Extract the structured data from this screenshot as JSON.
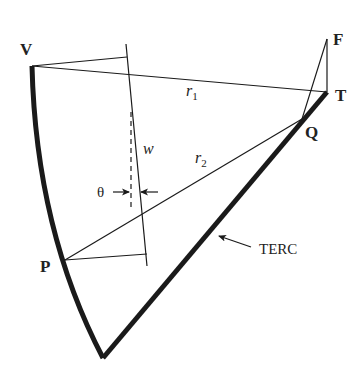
{
  "diagram": {
    "points": {
      "V": {
        "label": "V",
        "x": 32,
        "y": 66
      },
      "T": {
        "label": "T",
        "x": 327,
        "y": 92
      },
      "F": {
        "label": "F",
        "x": 327,
        "y": 39
      },
      "Q": {
        "label": "Q",
        "x": 302,
        "y": 119
      },
      "P": {
        "label": "P",
        "x": 65,
        "y": 260
      },
      "bottom": {
        "x": 103,
        "y": 358
      }
    },
    "labels": {
      "V": "V",
      "T": "T",
      "F": "F",
      "Q": "Q",
      "P": "P",
      "r1_base": "r",
      "r1_sub": "1",
      "r2_base": "r",
      "r2_sub": "2",
      "w": "w",
      "theta": "θ",
      "terc": "TERC"
    },
    "colors": {
      "stroke": "#1a1a1a",
      "background": "#ffffff"
    }
  }
}
